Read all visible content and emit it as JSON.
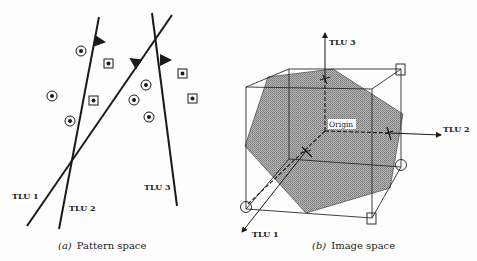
{
  "figure": {
    "panel_a": {
      "caption_letter": "(a)",
      "caption_text": "Pattern space",
      "lines": [
        {
          "label": "TLU 1"
        },
        {
          "label": "TLU 2"
        },
        {
          "label": "TLU 3"
        }
      ],
      "pattern_classes": [
        "circle-dot",
        "square-dot"
      ]
    },
    "panel_b": {
      "caption_letter": "(b)",
      "caption_text": "Image space",
      "axes": {
        "x": "TLU 1",
        "y": "TLU 2",
        "z": "TLU 3"
      },
      "origin_label": "Origin"
    }
  },
  "colors": {
    "ink": "#1a1a1a",
    "shade": "#9a9a9a",
    "background": "#fefefe"
  }
}
